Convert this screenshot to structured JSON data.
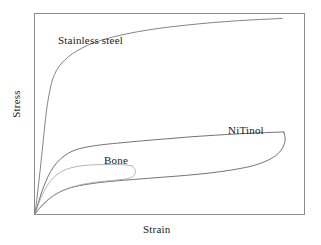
{
  "figure": {
    "background_color": "#ffffff",
    "frame_color": "#8c8c8c",
    "width": 321,
    "height": 245
  },
  "axes": {
    "xlabel": "Strain",
    "ylabel": "Stress"
  },
  "labels": {
    "stainless_steel": "Stainless steel",
    "nitinol": "NiTinol",
    "bone": "Bone"
  },
  "chart_data": {
    "type": "line",
    "title": "",
    "subtitle": "",
    "xlabel": "Strain",
    "ylabel": "Stress",
    "xlim": [
      0,
      1
    ],
    "ylim": [
      0,
      1
    ],
    "xticks": [],
    "yticks": [],
    "grid": false,
    "legend": "inline-annotations",
    "annotations": [
      {
        "text": "Stainless steel",
        "x": 0.09,
        "y": 0.87
      },
      {
        "text": "NiTinol",
        "x": 0.72,
        "y": 0.42
      },
      {
        "text": "Bone",
        "x": 0.26,
        "y": 0.27
      }
    ],
    "series": [
      {
        "name": "Stainless steel",
        "color": "#6e6e6e",
        "closed_loop": false,
        "description": "Steep elastic rise then sharp yield knee and gradual work-hardening plateau to the upper right corner",
        "points": [
          [
            0.0,
            0.0
          ],
          [
            0.01,
            0.11
          ],
          [
            0.02,
            0.23
          ],
          [
            0.029,
            0.345
          ],
          [
            0.037,
            0.45
          ],
          [
            0.044,
            0.53
          ],
          [
            0.05,
            0.58
          ],
          [
            0.057,
            0.63
          ],
          [
            0.066,
            0.675
          ],
          [
            0.08,
            0.718
          ],
          [
            0.1,
            0.755
          ],
          [
            0.125,
            0.787
          ],
          [
            0.155,
            0.815
          ],
          [
            0.195,
            0.843
          ],
          [
            0.245,
            0.868
          ],
          [
            0.305,
            0.89
          ],
          [
            0.38,
            0.911
          ],
          [
            0.465,
            0.929
          ],
          [
            0.56,
            0.944
          ],
          [
            0.66,
            0.957
          ],
          [
            0.76,
            0.967
          ],
          [
            0.86,
            0.974
          ],
          [
            0.92,
            0.978
          ]
        ]
      },
      {
        "name": "NiTinol",
        "color": "#5a5a5a",
        "closed_loop": true,
        "description": "Superelastic hysteresis loop: loading rise to an upper stress plateau, then unloading along a lower plateau returning to origin",
        "loading_points": [
          [
            0.0,
            0.0
          ],
          [
            0.012,
            0.055
          ],
          [
            0.025,
            0.11
          ],
          [
            0.04,
            0.162
          ],
          [
            0.058,
            0.212
          ],
          [
            0.08,
            0.255
          ],
          [
            0.108,
            0.29
          ],
          [
            0.14,
            0.315
          ],
          [
            0.175,
            0.33
          ],
          [
            0.215,
            0.34
          ],
          [
            0.26,
            0.348
          ],
          [
            0.32,
            0.356
          ],
          [
            0.4,
            0.366
          ],
          [
            0.49,
            0.376
          ],
          [
            0.58,
            0.386
          ],
          [
            0.67,
            0.394
          ],
          [
            0.76,
            0.401
          ],
          [
            0.84,
            0.406
          ],
          [
            0.9,
            0.409
          ],
          [
            0.925,
            0.41
          ]
        ],
        "unloading_points": [
          [
            0.925,
            0.41
          ],
          [
            0.93,
            0.372
          ],
          [
            0.92,
            0.33
          ],
          [
            0.895,
            0.292
          ],
          [
            0.855,
            0.262
          ],
          [
            0.8,
            0.238
          ],
          [
            0.73,
            0.22
          ],
          [
            0.65,
            0.205
          ],
          [
            0.56,
            0.193
          ],
          [
            0.465,
            0.183
          ],
          [
            0.37,
            0.173
          ],
          [
            0.28,
            0.163
          ],
          [
            0.2,
            0.15
          ],
          [
            0.135,
            0.132
          ],
          [
            0.085,
            0.105
          ],
          [
            0.048,
            0.07
          ],
          [
            0.022,
            0.036
          ],
          [
            0.0,
            0.0
          ]
        ]
      },
      {
        "name": "Bone",
        "color": "#a8a8a8",
        "closed_loop": true,
        "description": "Small low-strain hysteresis loop with a short plateau that closes back near the origin",
        "loading_points": [
          [
            0.0,
            0.0
          ],
          [
            0.01,
            0.038
          ],
          [
            0.022,
            0.08
          ],
          [
            0.038,
            0.124
          ],
          [
            0.056,
            0.162
          ],
          [
            0.078,
            0.193
          ],
          [
            0.104,
            0.216
          ],
          [
            0.134,
            0.231
          ],
          [
            0.168,
            0.24
          ],
          [
            0.205,
            0.245
          ],
          [
            0.245,
            0.247
          ],
          [
            0.29,
            0.248
          ],
          [
            0.33,
            0.246
          ],
          [
            0.362,
            0.24
          ]
        ],
        "unloading_points": [
          [
            0.362,
            0.24
          ],
          [
            0.372,
            0.222
          ],
          [
            0.372,
            0.202
          ],
          [
            0.362,
            0.186
          ],
          [
            0.34,
            0.176
          ],
          [
            0.305,
            0.17
          ],
          [
            0.26,
            0.164
          ],
          [
            0.21,
            0.156
          ],
          [
            0.162,
            0.144
          ],
          [
            0.118,
            0.126
          ],
          [
            0.08,
            0.102
          ],
          [
            0.048,
            0.072
          ],
          [
            0.022,
            0.038
          ],
          [
            0.0,
            0.0
          ]
        ]
      }
    ]
  }
}
